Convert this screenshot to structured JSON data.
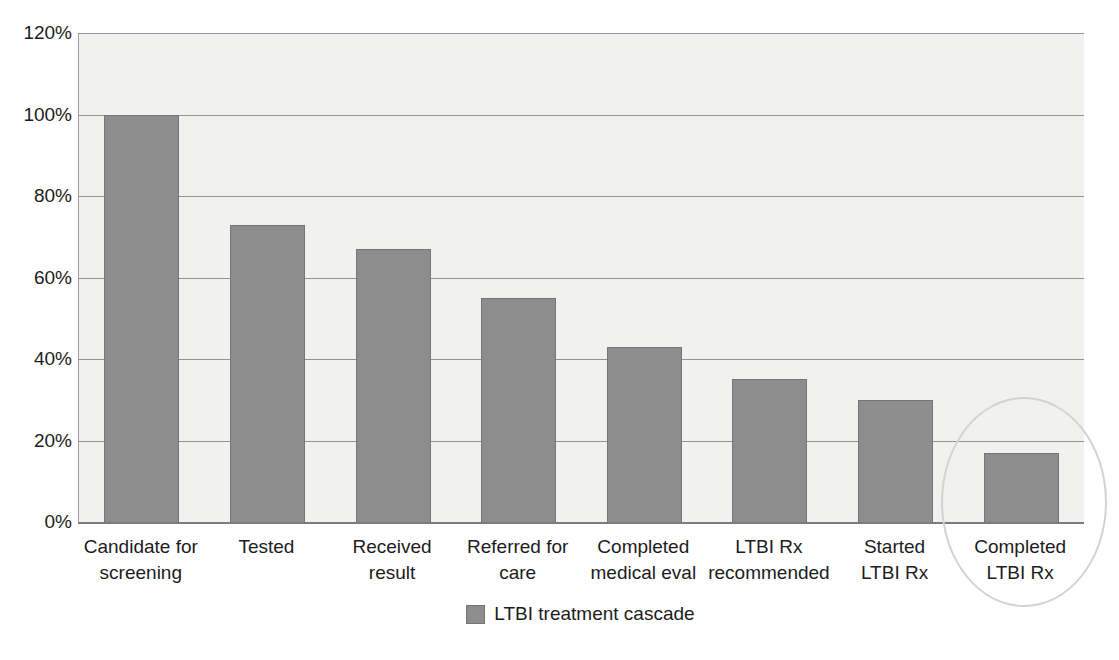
{
  "chart_data": {
    "type": "bar",
    "title": "",
    "categories": [
      "Candidate for screening",
      "Tested",
      "Received result",
      "Referred for care",
      "Completed medical eval",
      "LTBI Rx recommended",
      "Started LTBI Rx",
      "Completed LTBI Rx"
    ],
    "category_lines": [
      [
        "Candidate for",
        "screening"
      ],
      [
        "Tested"
      ],
      [
        "Received",
        "result"
      ],
      [
        "Referred for",
        "care"
      ],
      [
        "Completed",
        "medical eval"
      ],
      [
        "LTBI Rx",
        "recommended"
      ],
      [
        "Started",
        "LTBI Rx"
      ],
      [
        "Completed",
        "LTBI Rx"
      ]
    ],
    "values": [
      100,
      73,
      67,
      55,
      43,
      35,
      30,
      17
    ],
    "unit": "%",
    "xlabel": "",
    "ylabel": "",
    "ylim": [
      0,
      120
    ],
    "yticks": [
      {
        "label": "120%",
        "value": 120
      },
      {
        "label": "100%",
        "value": 100
      },
      {
        "label": "80%",
        "value": 80
      },
      {
        "label": "60%",
        "value": 60
      },
      {
        "label": "40%",
        "value": 40
      },
      {
        "label": "20%",
        "value": 20
      },
      {
        "label": "0%",
        "value": 0
      }
    ],
    "grid": true,
    "legend": {
      "label": "LTBI treatment cascade",
      "position": "bottom"
    },
    "annotation": {
      "type": "ellipse",
      "target_category": "Completed LTBI Rx"
    }
  },
  "colors": {
    "bar_fill": "#8d8d8d",
    "bar_border": "#757575",
    "plot_bg": "#f1f1ef",
    "gridline": "#929292",
    "axis_line": "#7c7c7c",
    "text": "#1c1c1c",
    "annotation_stroke": "#d3d3d3",
    "background": "#ffffff"
  }
}
